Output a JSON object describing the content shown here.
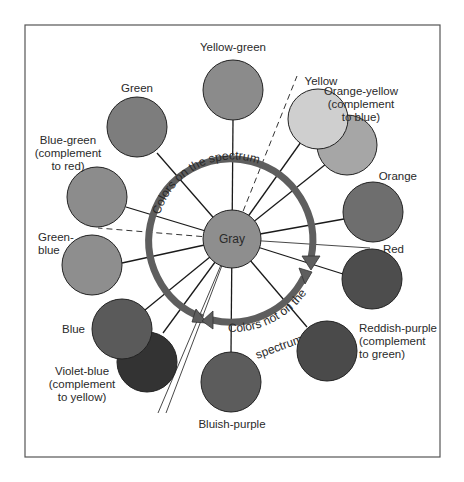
{
  "diagram": {
    "center": {
      "label": "Gray",
      "color": "#8e8e8e"
    },
    "ring": {
      "top_arc_label": "Colors on the spectrum",
      "bottom_arc_label_line1": "Colors not on the",
      "bottom_arc_label_line2": "spectrum",
      "color": "#5e5e5e"
    },
    "colors": [
      {
        "id": "yellow-green",
        "label_lines": [
          "Yellow-green"
        ],
        "color": "#8b8b8b"
      },
      {
        "id": "green",
        "label_lines": [
          "Green"
        ],
        "color": "#7d7d7d"
      },
      {
        "id": "blue-green",
        "label_lines": [
          "Blue-green",
          "(complement",
          "to red)"
        ],
        "color": "#8c8c8c"
      },
      {
        "id": "green-blue",
        "label_lines": [
          "Green-",
          "blue"
        ],
        "color": "#8e8e8e"
      },
      {
        "id": "blue",
        "label_lines": [
          "Blue"
        ],
        "color": "#5a5a5a"
      },
      {
        "id": "violet-blue",
        "label_lines": [
          "Violet-blue",
          "(complement",
          "to yellow)"
        ],
        "color": "#333333"
      },
      {
        "id": "bluish-purple",
        "label_lines": [
          "Bluish-purple"
        ],
        "color": "#5c5c5c"
      },
      {
        "id": "reddish-purple",
        "label_lines": [
          "Reddish-purple",
          "(complement",
          "to green)"
        ],
        "color": "#4a4a4a"
      },
      {
        "id": "red",
        "label_lines": [
          "Red"
        ],
        "color": "#4d4d4d"
      },
      {
        "id": "orange",
        "label_lines": [
          "Orange"
        ],
        "color": "#6e6e6e"
      },
      {
        "id": "yellow",
        "label_lines": [
          "Yellow"
        ],
        "color": "#cfcfcf"
      },
      {
        "id": "orange-yellow",
        "label_lines": [
          "Orange-yellow",
          "(complement",
          "to blue)"
        ],
        "color": "#a6a6a6"
      }
    ],
    "border_color": "#555555"
  }
}
